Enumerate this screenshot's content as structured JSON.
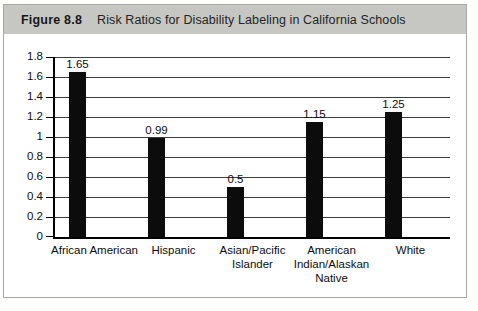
{
  "figure": {
    "label": "Figure 8.8",
    "title": "Risk Ratios for Disability Labeling in California Schools"
  },
  "colors": {
    "header_bg": "#c6c7c2",
    "figure_border": "#a8a8a4",
    "bar": "#0c0c0c",
    "gridline": "#3c3c3c",
    "axis": "#000000",
    "text": "#0d0d0d"
  },
  "chart_data": {
    "type": "bar",
    "title": "Risk Ratios for Disability Labeling in California Schools",
    "categories": [
      "African American",
      "Hispanic",
      "Asian/Pacific Islander",
      "American Indian/Alaskan Native",
      "White"
    ],
    "values": [
      1.65,
      0.99,
      0.5,
      1.15,
      1.25
    ],
    "value_labels": [
      "1.65",
      "0.99",
      "0.5",
      "1.15",
      "1.25"
    ],
    "xlabel": "",
    "ylabel": "",
    "ylim": [
      0,
      1.8
    ],
    "ytick_values": [
      0,
      0.2,
      0.4,
      0.6,
      0.8,
      1,
      1.2,
      1.4,
      1.6,
      1.8
    ],
    "ytick_labels": [
      "0",
      "0.2",
      "0.4",
      "0.6",
      "0.8",
      "1",
      "1.2",
      "1.4",
      "1.6",
      "1.8"
    ],
    "grid": true,
    "legend": false,
    "bar_color": "#0c0c0c"
  }
}
